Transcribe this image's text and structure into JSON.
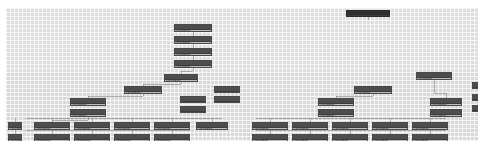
{
  "app": {
    "title": "Org Chart Canvas",
    "view": "tree-diagram",
    "zoom_level": "25%"
  },
  "canvas": {
    "background_color": "#d8d8d8",
    "grid_minor_color": "#ffffff",
    "grid_major_color": "#969696",
    "grid_minor_size_px": 4,
    "grid_major_size_px": 20,
    "link_color": "#8e8e8e",
    "node_fill_color": "#bdbdbd",
    "node_border_color": "#4a4a4a",
    "node_header_color": "#4d4d4d",
    "root_fill_color": "#4a4a4a"
  },
  "nodes": [
    {
      "id": "n1",
      "label": "Development",
      "x": 340,
      "y": 2,
      "w": 44,
      "h": 7,
      "style": "root"
    },
    {
      "id": "n2",
      "label": "Development",
      "x": 168,
      "y": 16,
      "w": 38,
      "h": 8,
      "style": "normal"
    },
    {
      "id": "n3",
      "label": "Development",
      "x": 168,
      "y": 28,
      "w": 38,
      "h": 8,
      "style": "normal"
    },
    {
      "id": "n4",
      "label": "Development",
      "x": 168,
      "y": 40,
      "w": 38,
      "h": 8,
      "style": "normal"
    },
    {
      "id": "n5",
      "label": "Development",
      "x": 168,
      "y": 52,
      "w": 38,
      "h": 8,
      "style": "normal"
    },
    {
      "id": "n6",
      "label": "Development",
      "x": 158,
      "y": 66,
      "w": 34,
      "h": 8,
      "style": "normal"
    },
    {
      "id": "n7",
      "label": "Development",
      "x": 410,
      "y": 64,
      "w": 36,
      "h": 8,
      "style": "normal"
    },
    {
      "id": "n8",
      "label": "Dev",
      "x": 466,
      "y": 74,
      "w": 18,
      "h": 7,
      "style": "normal"
    },
    {
      "id": "n9",
      "label": "Development",
      "x": 118,
      "y": 78,
      "w": 38,
      "h": 8,
      "style": "normal"
    },
    {
      "id": "n10",
      "label": "Development",
      "x": 348,
      "y": 78,
      "w": 38,
      "h": 8,
      "style": "normal"
    },
    {
      "id": "n11",
      "label": "Activity",
      "x": 208,
      "y": 78,
      "w": 26,
      "h": 7,
      "style": "light"
    },
    {
      "id": "n12",
      "label": "Activity",
      "x": 174,
      "y": 88,
      "w": 26,
      "h": 7,
      "style": "light"
    },
    {
      "id": "n13",
      "label": "Activity",
      "x": 208,
      "y": 88,
      "w": 26,
      "h": 7,
      "style": "light"
    },
    {
      "id": "n14",
      "label": "Activity",
      "x": 174,
      "y": 98,
      "w": 26,
      "h": 7,
      "style": "light"
    },
    {
      "id": "n15",
      "label": "Development",
      "x": 64,
      "y": 90,
      "w": 36,
      "h": 8,
      "style": "normal"
    },
    {
      "id": "n16",
      "label": "Development",
      "x": 64,
      "y": 101,
      "w": 36,
      "h": 8,
      "style": "normal"
    },
    {
      "id": "n17",
      "label": "Development",
      "x": 312,
      "y": 90,
      "w": 36,
      "h": 8,
      "style": "normal"
    },
    {
      "id": "n18",
      "label": "Development",
      "x": 312,
      "y": 101,
      "w": 36,
      "h": 8,
      "style": "normal"
    },
    {
      "id": "n19",
      "label": "Development",
      "x": 424,
      "y": 90,
      "w": 32,
      "h": 8,
      "style": "normal"
    },
    {
      "id": "n20",
      "label": "Development",
      "x": 424,
      "y": 101,
      "w": 32,
      "h": 8,
      "style": "normal"
    },
    {
      "id": "n21",
      "label": "Dev",
      "x": 466,
      "y": 86,
      "w": 18,
      "h": 7,
      "style": "normal"
    },
    {
      "id": "n22",
      "label": "Dev",
      "x": 466,
      "y": 97,
      "w": 18,
      "h": 7,
      "style": "normal"
    },
    {
      "id": "n23",
      "label": "Development",
      "x": 2,
      "y": 114,
      "w": 14,
      "h": 8,
      "style": "normal"
    },
    {
      "id": "n24",
      "label": "Development",
      "x": 2,
      "y": 126,
      "w": 14,
      "h": 8,
      "style": "normal"
    },
    {
      "id": "n25",
      "label": "Development",
      "x": 28,
      "y": 114,
      "w": 36,
      "h": 8,
      "style": "normal"
    },
    {
      "id": "n26",
      "label": "Development",
      "x": 28,
      "y": 126,
      "w": 36,
      "h": 8,
      "style": "normal"
    },
    {
      "id": "n27",
      "label": "Development",
      "x": 68,
      "y": 114,
      "w": 36,
      "h": 8,
      "style": "normal"
    },
    {
      "id": "n28",
      "label": "Development",
      "x": 68,
      "y": 126,
      "w": 36,
      "h": 8,
      "style": "normal"
    },
    {
      "id": "n29",
      "label": "Development",
      "x": 108,
      "y": 114,
      "w": 36,
      "h": 8,
      "style": "normal"
    },
    {
      "id": "n30",
      "label": "Development",
      "x": 108,
      "y": 126,
      "w": 36,
      "h": 8,
      "style": "normal"
    },
    {
      "id": "n31",
      "label": "Development",
      "x": 148,
      "y": 114,
      "w": 36,
      "h": 8,
      "style": "normal"
    },
    {
      "id": "n32",
      "label": "Development",
      "x": 148,
      "y": 126,
      "w": 36,
      "h": 8,
      "style": "normal"
    },
    {
      "id": "n33",
      "label": "Development",
      "x": 190,
      "y": 114,
      "w": 32,
      "h": 8,
      "style": "normal"
    },
    {
      "id": "n34",
      "label": "Development",
      "x": 246,
      "y": 114,
      "w": 36,
      "h": 8,
      "style": "normal"
    },
    {
      "id": "n35",
      "label": "Development",
      "x": 246,
      "y": 126,
      "w": 36,
      "h": 8,
      "style": "normal"
    },
    {
      "id": "n36",
      "label": "Development",
      "x": 286,
      "y": 114,
      "w": 36,
      "h": 8,
      "style": "normal"
    },
    {
      "id": "n37",
      "label": "Development",
      "x": 286,
      "y": 126,
      "w": 36,
      "h": 8,
      "style": "normal"
    },
    {
      "id": "n38",
      "label": "Development",
      "x": 326,
      "y": 114,
      "w": 36,
      "h": 8,
      "style": "normal"
    },
    {
      "id": "n39",
      "label": "Development",
      "x": 326,
      "y": 126,
      "w": 36,
      "h": 8,
      "style": "normal"
    },
    {
      "id": "n40",
      "label": "Development",
      "x": 366,
      "y": 114,
      "w": 36,
      "h": 8,
      "style": "normal"
    },
    {
      "id": "n41",
      "label": "Development",
      "x": 366,
      "y": 126,
      "w": 36,
      "h": 8,
      "style": "normal"
    },
    {
      "id": "n42",
      "label": "Development",
      "x": 406,
      "y": 114,
      "w": 36,
      "h": 8,
      "style": "normal"
    },
    {
      "id": "n43",
      "label": "Development",
      "x": 406,
      "y": 126,
      "w": 36,
      "h": 8,
      "style": "normal"
    }
  ],
  "links": [
    {
      "from": "n1",
      "to": "n2",
      "x1": 362,
      "y1": 9,
      "x2": 362,
      "y2": 12,
      "mid": 12
    },
    {
      "from": "n2",
      "to": "n3",
      "x1": 187,
      "y1": 24,
      "x2": 187,
      "y2": 28,
      "mid": 26
    },
    {
      "from": "n3",
      "to": "n4",
      "x1": 187,
      "y1": 36,
      "x2": 187,
      "y2": 40,
      "mid": 38
    },
    {
      "from": "n4",
      "to": "n5",
      "x1": 187,
      "y1": 48,
      "x2": 187,
      "y2": 52,
      "mid": 50
    },
    {
      "from": "n5",
      "to": "n6",
      "x1": 187,
      "y1": 60,
      "x2": 175,
      "y2": 66,
      "mid": 63
    },
    {
      "from": "n6",
      "to": "n9",
      "x1": 175,
      "y1": 74,
      "x2": 137,
      "y2": 78,
      "mid": 76
    },
    {
      "from": "n9",
      "to": "n15",
      "x1": 137,
      "y1": 86,
      "x2": 82,
      "y2": 90,
      "mid": 88
    },
    {
      "from": "n15",
      "to": "n25",
      "x1": 82,
      "y1": 109,
      "x2": 46,
      "y2": 114,
      "mid": 112
    },
    {
      "from": "n10",
      "to": "n17",
      "x1": 367,
      "y1": 86,
      "x2": 330,
      "y2": 90,
      "mid": 88
    },
    {
      "from": "n7",
      "to": "n19",
      "x1": 428,
      "y1": 72,
      "x2": 440,
      "y2": 90,
      "mid": 85
    }
  ]
}
